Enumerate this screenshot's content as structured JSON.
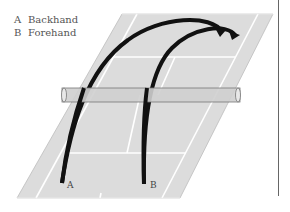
{
  "legend": {
    "items": [
      {
        "key": "A",
        "label": "Backhand"
      },
      {
        "key": "B",
        "label": "Forehand"
      }
    ]
  },
  "shot_labels": {
    "a": "A",
    "b": "B"
  },
  "colors": {
    "court": "#dcdcdc",
    "court_lines": "#ffffff",
    "trajectory": "#111111",
    "net": "#cfcfcf",
    "net_outline": "#777777",
    "frame": "#666666"
  }
}
